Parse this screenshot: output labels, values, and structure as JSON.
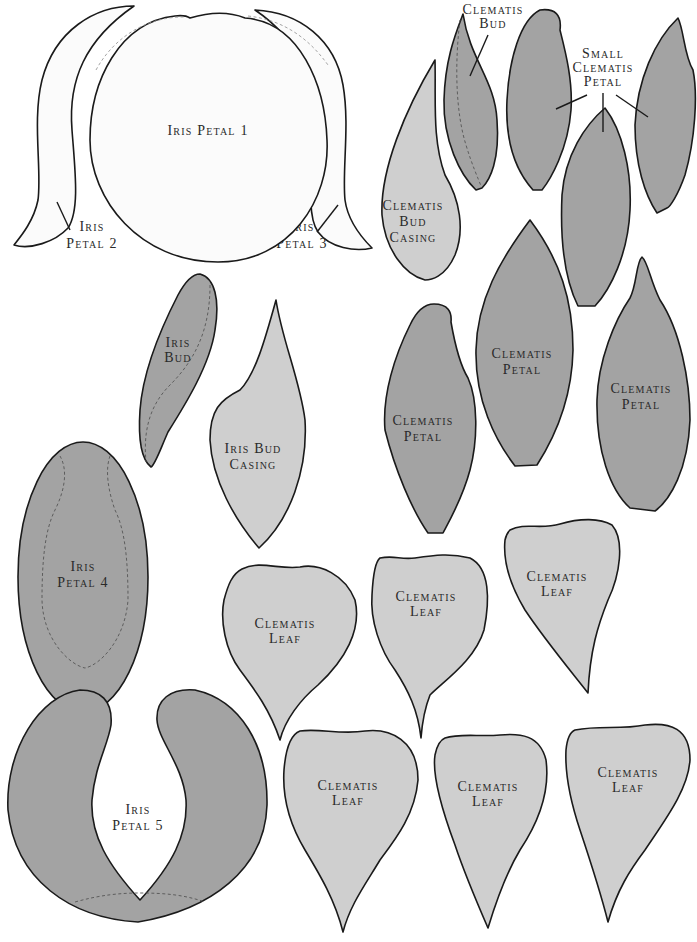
{
  "colors": {
    "outline": "#1a1a1a",
    "white_piece": "#fbfbfb",
    "light_piece": "#cfcfcf",
    "dark_piece": "#a3a3a3",
    "background": "#ffffff"
  },
  "labels": {
    "iris_petal_1": {
      "line1": "Iris Petal 1"
    },
    "iris_petal_2": {
      "line1": "Iris",
      "line2": "Petal 2"
    },
    "iris_petal_3": {
      "line1": "Iris",
      "line2": "Petal 3"
    },
    "iris_petal_4": {
      "line1": "Iris",
      "line2": "Petal 4"
    },
    "iris_petal_5": {
      "line1": "Iris",
      "line2": "Petal 5"
    },
    "iris_bud": {
      "line1": "Iris",
      "line2": "Bud"
    },
    "iris_bud_casing": {
      "line1": "Iris Bud",
      "line2": "Casing"
    },
    "clematis_bud": {
      "line1": "Clematis",
      "line2": "Bud"
    },
    "clematis_bud_casing": {
      "line1": "Clematis",
      "line2": "Bud",
      "line3": "Casing"
    },
    "small_clematis_petal": {
      "line1": "Small",
      "line2": "Clematis",
      "line3": "Petal"
    },
    "clematis_petal_a": {
      "line1": "Clematis",
      "line2": "Petal"
    },
    "clematis_petal_b": {
      "line1": "Clematis",
      "line2": "Petal"
    },
    "clematis_petal_c": {
      "line1": "Clematis",
      "line2": "Petal"
    },
    "clematis_leaf_1": {
      "line1": "Clematis",
      "line2": "Leaf"
    },
    "clematis_leaf_2": {
      "line1": "Clematis",
      "line2": "Leaf"
    },
    "clematis_leaf_3": {
      "line1": "Clematis",
      "line2": "Leaf"
    },
    "clematis_leaf_4": {
      "line1": "Clematis",
      "line2": "Leaf"
    },
    "clematis_leaf_5": {
      "line1": "Clematis",
      "line2": "Leaf"
    },
    "clematis_leaf_6": {
      "line1": "Clematis",
      "line2": "Leaf"
    }
  }
}
